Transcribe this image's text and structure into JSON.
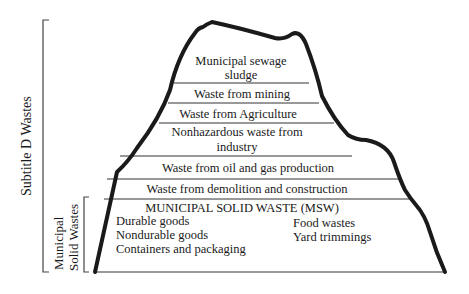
{
  "brackets": {
    "outer_label": "Subtitle D Wastes",
    "inner_label_line1": "Municipal",
    "inner_label_line2": "Solid Wastes"
  },
  "layers": [
    {
      "line1": "Municipal sewage",
      "line2": "sludge"
    },
    {
      "line1": "Waste from mining"
    },
    {
      "line1": "Waste from Agriculture"
    },
    {
      "line1": "Nonhazardous waste from",
      "line2": "industry"
    },
    {
      "line1": "Waste from oil and gas production"
    },
    {
      "line1": "Waste from demolition and construction"
    }
  ],
  "msw": {
    "heading": "MUNICIPAL SOLID WASTE (MSW)",
    "left_items": [
      "Durable goods",
      "Nondurable goods",
      "Containers and packaging"
    ],
    "right_items": [
      "Food wastes",
      "Yard trimmings"
    ]
  },
  "colors": {
    "outline": "#1a1a1a",
    "lines": "#333333",
    "bracket": "#444444"
  }
}
